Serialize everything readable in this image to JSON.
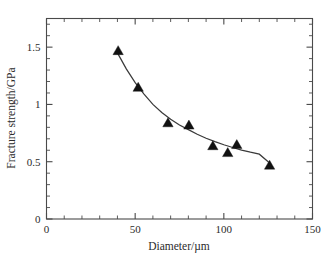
{
  "chart_data": {
    "type": "scatter",
    "title": "",
    "subtitle": "",
    "xlabel": "Diameter/µm",
    "ylabel": "Fracture strength/GPa",
    "xlim": [
      0,
      150
    ],
    "ylim": [
      0,
      1.75
    ],
    "grid": false,
    "legend": null,
    "x_ticks_major": [
      0,
      50,
      100,
      150
    ],
    "x_tick_labels": [
      "0",
      "50",
      "100",
      "150"
    ],
    "x_minor_step": 10,
    "y_ticks_major": [
      0,
      0.5,
      1,
      1.5
    ],
    "y_tick_labels": [
      "0",
      "0.5",
      "1",
      "1.5"
    ],
    "y_minor_step": 0.1,
    "marker_shape": "triangle-up",
    "marker_color": "#111111",
    "curve_color": "#3a3a3a",
    "series": [
      {
        "name": "Fracture strength vs diameter",
        "x": [
          40.4,
          51.7,
          68.5,
          80.3,
          93.8,
          102.2,
          107.3,
          125.8
        ],
        "y": [
          1.47,
          1.15,
          0.84,
          0.82,
          0.64,
          0.58,
          0.65,
          0.47
        ]
      }
    ],
    "fit_curve": {
      "name": "decreasing power-law fit",
      "x": [
        40,
        45,
        50,
        55,
        60,
        65,
        70,
        75,
        80,
        85,
        90,
        95,
        100,
        105,
        110,
        115,
        120,
        125,
        126
      ],
      "y": [
        1.45,
        1.31,
        1.19,
        1.09,
        1.0,
        0.93,
        0.87,
        0.82,
        0.78,
        0.74,
        0.705,
        0.675,
        0.648,
        0.624,
        0.602,
        0.583,
        0.566,
        0.5,
        0.49
      ]
    }
  },
  "axes": {
    "x_axis_name": "diameter-axis",
    "y_axis_name": "fracture-strength-axis"
  }
}
